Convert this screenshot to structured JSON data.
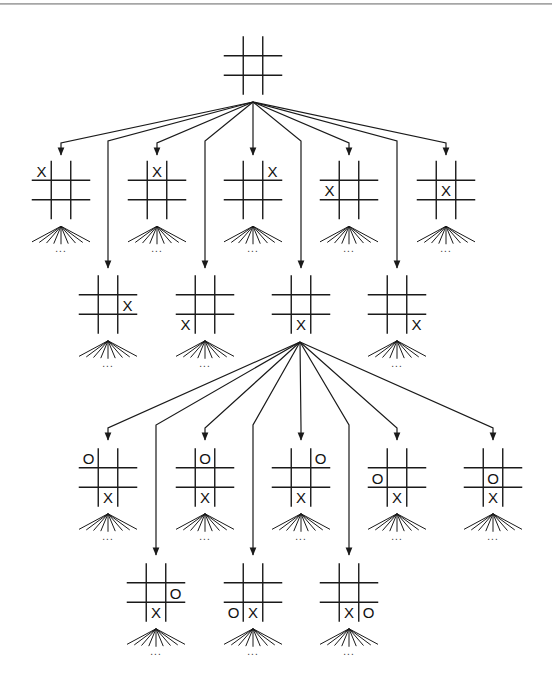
{
  "diagram": {
    "continuation_label": "...",
    "colors": {
      "line": "#1a1a1a",
      "background": "#ffffff",
      "top_rule": "#9a9a9a"
    },
    "cell_size": 19.5,
    "root": {
      "id": "root",
      "cx": 253,
      "cy": 65.5,
      "cells": [
        "",
        "",
        "",
        "",
        "",
        "",
        "",
        "",
        ""
      ],
      "apex": [
        253,
        102
      ]
    },
    "levels": [
      {
        "name": "X first moves (row 1)",
        "parent": "root",
        "bend_y": 143,
        "arrow_y": 155,
        "cy": 190,
        "nodes": [
          {
            "id": "x-tl",
            "cx": 61,
            "cells": [
              "X",
              "",
              "",
              "",
              "",
              "",
              "",
              "",
              ""
            ]
          },
          {
            "id": "x-tm",
            "cx": 157,
            "cells": [
              "",
              "X",
              "",
              "",
              "",
              "",
              "",
              "",
              ""
            ]
          },
          {
            "id": "x-tr",
            "cx": 253,
            "cells": [
              "",
              "",
              "X",
              "",
              "",
              "",
              "",
              "",
              ""
            ]
          },
          {
            "id": "x-ml",
            "cx": 349,
            "cells": [
              "",
              "",
              "",
              "X",
              "",
              "",
              "",
              "",
              ""
            ]
          },
          {
            "id": "x-c",
            "cx": 446,
            "cells": [
              "",
              "",
              "",
              "",
              "X",
              "",
              "",
              "",
              ""
            ]
          }
        ]
      },
      {
        "name": "X first moves (row 2)",
        "parent": "root",
        "bend_y": 141,
        "arrow_y": 268,
        "cy": 304.5,
        "nodes": [
          {
            "id": "x-mr",
            "cx": 108,
            "cells": [
              "",
              "",
              "",
              "",
              "",
              "X",
              "",
              "",
              ""
            ]
          },
          {
            "id": "x-bl",
            "cx": 205,
            "cells": [
              "",
              "",
              "",
              "",
              "",
              "",
              "X",
              "",
              ""
            ]
          },
          {
            "id": "x-bm",
            "cx": 301,
            "cells": [
              "",
              "",
              "",
              "",
              "",
              "",
              "",
              "X",
              ""
            ],
            "expanded": true
          },
          {
            "id": "x-br",
            "cx": 397,
            "cells": [
              "",
              "",
              "",
              "",
              "",
              "",
              "",
              "",
              "X"
            ]
          }
        ]
      },
      {
        "name": "O replies to X bottom-middle (row 3)",
        "parent": "x-bm",
        "bend_y": 428,
        "arrow_y": 440,
        "cy": 477.5,
        "nodes": [
          {
            "id": "o-tl",
            "cx": 108,
            "cells": [
              "O",
              "",
              "",
              "",
              "",
              "",
              "",
              "X",
              ""
            ]
          },
          {
            "id": "o-tm",
            "cx": 205,
            "cells": [
              "",
              "O",
              "",
              "",
              "",
              "",
              "",
              "X",
              ""
            ]
          },
          {
            "id": "o-tr",
            "cx": 301,
            "cells": [
              "",
              "",
              "O",
              "",
              "",
              "",
              "",
              "X",
              ""
            ]
          },
          {
            "id": "o-ml",
            "cx": 397,
            "cells": [
              "",
              "",
              "",
              "O",
              "",
              "",
              "",
              "X",
              ""
            ]
          },
          {
            "id": "o-c",
            "cx": 493,
            "cells": [
              "",
              "",
              "",
              "",
              "O",
              "",
              "",
              "X",
              ""
            ]
          }
        ]
      },
      {
        "name": "O replies to X bottom-middle (row 4)",
        "parent": "x-bm",
        "bend_y": 425,
        "arrow_y": 555,
        "cy": 592.5,
        "nodes": [
          {
            "id": "o-mr",
            "cx": 156,
            "cells": [
              "",
              "",
              "",
              "",
              "",
              "O",
              "",
              "X",
              ""
            ]
          },
          {
            "id": "o-bl",
            "cx": 253,
            "cells": [
              "",
              "",
              "",
              "",
              "",
              "",
              "O",
              "X",
              ""
            ]
          },
          {
            "id": "o-br",
            "cx": 349,
            "cells": [
              "",
              "",
              "",
              "",
              "",
              "",
              "",
              "X",
              "O"
            ]
          }
        ]
      }
    ],
    "expanded_apex": [
      300,
      342
    ]
  }
}
